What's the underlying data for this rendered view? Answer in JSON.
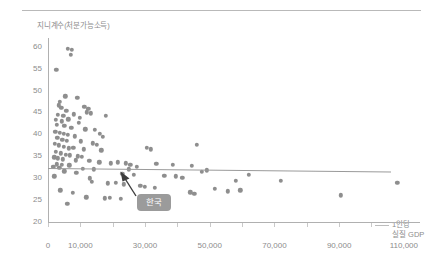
{
  "chart_data": {
    "type": "scatter",
    "title": "",
    "ylabel": "지니계수(처분가능소득)",
    "xlabel": "1인당\n실질 GDP",
    "xlabel_line1": "1인당",
    "xlabel_line2": "실질 GDP",
    "xlim": [
      0,
      115000
    ],
    "ylim": [
      20,
      62
    ],
    "grid": false,
    "legend": null,
    "y_ticks": [
      20,
      25,
      30,
      35,
      40,
      45,
      50,
      55,
      60
    ],
    "y_tick_labels": [
      "20",
      "25",
      "30",
      "35",
      "40",
      "45",
      "50",
      "55",
      "60"
    ],
    "x_ticks": [
      0,
      10000,
      30000,
      50000,
      70000,
      90000,
      110000
    ],
    "x_tick_labels": [
      "0",
      "10,000",
      "30,000",
      "50,000",
      "70,000",
      "90,000",
      "110,000"
    ],
    "point_color": "#8e8e8e",
    "trend_color": "#9a9a9a",
    "axis_color": "#b0b0b0",
    "text_color": "#8c8c8c",
    "annotation": {
      "label": "한국",
      "background": "#9b9b9b",
      "text_color": "#ffffff",
      "points_to": {
        "x": 25000,
        "y": 32
      }
    },
    "trend": {
      "type": "line",
      "x_start": 0,
      "y_start": 32.4,
      "x_end": 106000,
      "y_end": 31.6
    },
    "points": [
      {
        "x": 6200,
        "y": 59.6
      },
      {
        "x": 7400,
        "y": 59.3
      },
      {
        "x": 7000,
        "y": 58.2
      },
      {
        "x": 2600,
        "y": 54.7
      },
      {
        "x": 5300,
        "y": 48.7
      },
      {
        "x": 9000,
        "y": 48.3
      },
      {
        "x": 3400,
        "y": 46.6
      },
      {
        "x": 4100,
        "y": 46.0
      },
      {
        "x": 11200,
        "y": 46.3
      },
      {
        "x": 12500,
        "y": 45.8
      },
      {
        "x": 12000,
        "y": 45.0
      },
      {
        "x": 13200,
        "y": 44.8
      },
      {
        "x": 3000,
        "y": 44.4
      },
      {
        "x": 4700,
        "y": 44.2
      },
      {
        "x": 17800,
        "y": 44.3
      },
      {
        "x": 2400,
        "y": 43.3
      },
      {
        "x": 4200,
        "y": 43.0
      },
      {
        "x": 6300,
        "y": 43.4
      },
      {
        "x": 9600,
        "y": 42.6
      },
      {
        "x": 2800,
        "y": 42.2
      },
      {
        "x": 5100,
        "y": 41.9
      },
      {
        "x": 7200,
        "y": 41.5
      },
      {
        "x": 11500,
        "y": 41.2
      },
      {
        "x": 14500,
        "y": 41.0
      },
      {
        "x": 2200,
        "y": 40.6
      },
      {
        "x": 3600,
        "y": 40.3
      },
      {
        "x": 4900,
        "y": 40.1
      },
      {
        "x": 6100,
        "y": 39.9
      },
      {
        "x": 8200,
        "y": 39.6
      },
      {
        "x": 2900,
        "y": 39.2
      },
      {
        "x": 4400,
        "y": 38.8
      },
      {
        "x": 5800,
        "y": 38.5
      },
      {
        "x": 10200,
        "y": 38.4
      },
      {
        "x": 13800,
        "y": 38.0
      },
      {
        "x": 2100,
        "y": 37.8
      },
      {
        "x": 3300,
        "y": 37.5
      },
      {
        "x": 4800,
        "y": 37.2
      },
      {
        "x": 7800,
        "y": 37.0
      },
      {
        "x": 11000,
        "y": 36.6
      },
      {
        "x": 16500,
        "y": 36.4
      },
      {
        "x": 2500,
        "y": 36.0
      },
      {
        "x": 3900,
        "y": 35.7
      },
      {
        "x": 5500,
        "y": 35.4
      },
      {
        "x": 6800,
        "y": 35.2
      },
      {
        "x": 9200,
        "y": 35.0
      },
      {
        "x": 1900,
        "y": 34.8
      },
      {
        "x": 3100,
        "y": 34.5
      },
      {
        "x": 4600,
        "y": 34.3
      },
      {
        "x": 8600,
        "y": 34.1
      },
      {
        "x": 12800,
        "y": 34.0
      },
      {
        "x": 15800,
        "y": 33.6
      },
      {
        "x": 19500,
        "y": 33.4
      },
      {
        "x": 2700,
        "y": 33.2
      },
      {
        "x": 4300,
        "y": 33.0
      },
      {
        "x": 6600,
        "y": 32.9
      },
      {
        "x": 30500,
        "y": 36.9
      },
      {
        "x": 31800,
        "y": 36.6
      },
      {
        "x": 46000,
        "y": 37.6
      },
      {
        "x": 1700,
        "y": 32.6
      },
      {
        "x": 3500,
        "y": 32.4
      },
      {
        "x": 10800,
        "y": 32.2
      },
      {
        "x": 14200,
        "y": 32.0
      },
      {
        "x": 21500,
        "y": 33.6
      },
      {
        "x": 24000,
        "y": 33.4
      },
      {
        "x": 25500,
        "y": 33.0
      },
      {
        "x": 27500,
        "y": 32.6
      },
      {
        "x": 33500,
        "y": 33.3
      },
      {
        "x": 38500,
        "y": 33.0
      },
      {
        "x": 44500,
        "y": 32.8
      },
      {
        "x": 25000,
        "y": 32.0
      },
      {
        "x": 23000,
        "y": 31.0
      },
      {
        "x": 26500,
        "y": 30.8
      },
      {
        "x": 36000,
        "y": 30.6
      },
      {
        "x": 39500,
        "y": 30.4
      },
      {
        "x": 41500,
        "y": 30.1
      },
      {
        "x": 47500,
        "y": 31.4
      },
      {
        "x": 49000,
        "y": 31.8
      },
      {
        "x": 12900,
        "y": 30.0
      },
      {
        "x": 13500,
        "y": 29.2
      },
      {
        "x": 18500,
        "y": 28.8
      },
      {
        "x": 21000,
        "y": 29.0
      },
      {
        "x": 23500,
        "y": 28.6
      },
      {
        "x": 28500,
        "y": 28.2
      },
      {
        "x": 30000,
        "y": 28.0
      },
      {
        "x": 33000,
        "y": 27.8
      },
      {
        "x": 3800,
        "y": 27.2
      },
      {
        "x": 7600,
        "y": 26.6
      },
      {
        "x": 44000,
        "y": 26.8
      },
      {
        "x": 45200,
        "y": 26.4
      },
      {
        "x": 51500,
        "y": 27.6
      },
      {
        "x": 55500,
        "y": 27.0
      },
      {
        "x": 59500,
        "y": 27.2
      },
      {
        "x": 58000,
        "y": 29.4
      },
      {
        "x": 62000,
        "y": 30.8
      },
      {
        "x": 72000,
        "y": 29.4
      },
      {
        "x": 90500,
        "y": 26.1
      },
      {
        "x": 108000,
        "y": 29.0
      },
      {
        "x": 6000,
        "y": 24.2
      },
      {
        "x": 11800,
        "y": 25.6
      },
      {
        "x": 17500,
        "y": 25.4
      },
      {
        "x": 19200,
        "y": 25.5
      },
      {
        "x": 22500,
        "y": 25.3
      },
      {
        "x": 5000,
        "y": 31.6
      },
      {
        "x": 8800,
        "y": 31.2
      },
      {
        "x": 2000,
        "y": 30.4
      },
      {
        "x": 9800,
        "y": 43.8
      },
      {
        "x": 3700,
        "y": 47.4
      },
      {
        "x": 16000,
        "y": 40.2
      },
      {
        "x": 17000,
        "y": 39.4
      },
      {
        "x": 15000,
        "y": 37.6
      },
      {
        "x": 5600,
        "y": 45.4
      },
      {
        "x": 8000,
        "y": 44.6
      },
      {
        "x": 6500,
        "y": 36.8
      },
      {
        "x": 10500,
        "y": 34.9
      }
    ]
  }
}
